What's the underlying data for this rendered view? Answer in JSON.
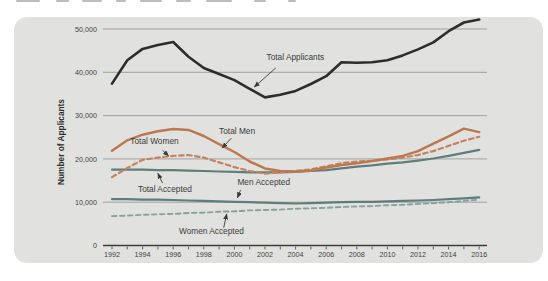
{
  "panel": {
    "background": "#e1e2e0"
  },
  "chart_data": {
    "type": "line",
    "title": "",
    "xlabel": "",
    "ylabel": "Number of Applicants",
    "grid": "horizontal",
    "legend_position": "none (inline annotated labels with arrows)",
    "xlim": [
      1991.4,
      2016.6
    ],
    "ylim": [
      0,
      53500
    ],
    "x": [
      1992,
      1993,
      1994,
      1995,
      1996,
      1997,
      1998,
      1999,
      2000,
      2001,
      2002,
      2003,
      2004,
      2005,
      2006,
      2007,
      2008,
      2009,
      2010,
      2011,
      2012,
      2013,
      2014,
      2015,
      2016
    ],
    "xticks": [
      1992,
      1994,
      1996,
      1998,
      2000,
      2002,
      2004,
      2006,
      2008,
      2010,
      2012,
      2014,
      2016
    ],
    "xtick_labels": [
      "1992",
      "1994",
      "1996",
      "1998",
      "2000",
      "2002",
      "2004",
      "2006",
      "2008",
      "2010",
      "2012",
      "2014",
      "2016"
    ],
    "yticks": [
      0,
      10000,
      20000,
      30000,
      40000,
      50000
    ],
    "ytick_labels": [
      "0",
      "10,000",
      "20,000",
      "30,000",
      "40,000",
      "50,000"
    ],
    "axis_color": "#3c3c3c",
    "gridline_color": "#999999",
    "series": [
      {
        "name": "Total Accepted",
        "color": "#5f7d7a",
        "style": "solid",
        "width": 2.2,
        "values": [
          17500,
          17500,
          17500,
          17400,
          17400,
          17300,
          17200,
          17100,
          17000,
          16900,
          16900,
          16900,
          17000,
          17200,
          17400,
          17800,
          18200,
          18500,
          18900,
          19200,
          19600,
          20100,
          20700,
          21400,
          22100
        ]
      },
      {
        "name": "Men Accepted",
        "color": "#5f7d7a",
        "style": "solid",
        "width": 2.2,
        "values": [
          10700,
          10700,
          10600,
          10600,
          10500,
          10400,
          10300,
          10200,
          10100,
          10000,
          9900,
          9800,
          9700,
          9800,
          9900,
          10000,
          10100,
          10100,
          10200,
          10300,
          10400,
          10500,
          10700,
          10900,
          11100
        ]
      },
      {
        "name": "Women Accepted",
        "color": "#87a19d",
        "style": "dashed",
        "width": 1.9,
        "values": [
          6800,
          6900,
          7100,
          7200,
          7300,
          7500,
          7600,
          7800,
          7900,
          8100,
          8200,
          8300,
          8500,
          8600,
          8700,
          8900,
          9000,
          9100,
          9300,
          9400,
          9600,
          9800,
          10000,
          10300,
          10600
        ]
      },
      {
        "name": "Total Women",
        "color": "#c4835f",
        "style": "dashed",
        "width": 2.2,
        "values": [
          15800,
          17900,
          19800,
          20300,
          20700,
          20900,
          20300,
          19200,
          18100,
          17200,
          16600,
          16900,
          17200,
          17600,
          18300,
          19000,
          19400,
          19600,
          19900,
          20300,
          20900,
          21800,
          23000,
          24200,
          25100
        ]
      },
      {
        "name": "Total Men",
        "color": "#bd7850",
        "style": "solid",
        "width": 2.5,
        "values": [
          21900,
          24300,
          25600,
          26400,
          26900,
          26700,
          25300,
          23400,
          21600,
          19400,
          17800,
          17200,
          17100,
          17300,
          18000,
          18600,
          19000,
          19500,
          20100,
          20700,
          21800,
          23500,
          25200,
          27000,
          26200
        ]
      },
      {
        "name": "Total Applicants",
        "color": "#2d2d2d",
        "style": "solid",
        "width": 2.6,
        "values": [
          37400,
          42800,
          45400,
          46300,
          47000,
          43600,
          41000,
          39600,
          38200,
          36200,
          34200,
          34800,
          35700,
          37300,
          39100,
          42300,
          42200,
          42300,
          42800,
          43900,
          45300,
          46900,
          49500,
          51500,
          52200
        ]
      }
    ],
    "annotations": [
      {
        "text": "Total Applicants",
        "label": {
          "x": 2002.1,
          "y": 43600,
          "anchor": "start"
        },
        "arrow": {
          "x1": 2002.7,
          "y1": 41000,
          "x2": 2001.3,
          "y2": 36600
        }
      },
      {
        "text": "Total Men",
        "label": {
          "x": 1999.0,
          "y": 26400,
          "anchor": "start"
        },
        "arrow": {
          "x1": 1999.8,
          "y1": 24800,
          "x2": 1999.2,
          "y2": 22500
        }
      },
      {
        "text": "Total Women",
        "label": {
          "x": 1993.2,
          "y": 24200,
          "anchor": "start"
        },
        "arrow": {
          "x1": 1995.3,
          "y1": 22000,
          "x2": 1995.7,
          "y2": 20700
        }
      },
      {
        "text": "Total Accepted",
        "label": {
          "x": 1993.7,
          "y": 13000,
          "anchor": "start"
        },
        "arrow": {
          "x1": 1995.3,
          "y1": 14400,
          "x2": 1995.0,
          "y2": 16700
        }
      },
      {
        "text": "Men Accepted",
        "label": {
          "x": 2000.2,
          "y": 14700,
          "anchor": "start"
        },
        "arrow": {
          "x1": 2000.4,
          "y1": 12800,
          "x2": 2000.2,
          "y2": 11000
        }
      },
      {
        "text": "Women Accepted",
        "label": {
          "x": 1998.5,
          "y": 3300,
          "anchor": "middle"
        },
        "arrow": {
          "x1": 1999.3,
          "y1": 4100,
          "x2": 1999.5,
          "y2": 7300
        }
      }
    ],
    "annotation_text_color": "#3a3a3a"
  }
}
